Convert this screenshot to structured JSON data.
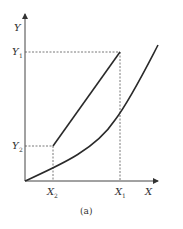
{
  "figure": {
    "caption": "(a)",
    "axes": {
      "x_label": "X",
      "y_label": "Y"
    },
    "y_ticks": [
      {
        "label": "Y",
        "sub": "1"
      },
      {
        "label": "Y",
        "sub": "2"
      }
    ],
    "x_ticks": [
      {
        "label": "X",
        "sub": "2"
      },
      {
        "label": "X",
        "sub": "1"
      }
    ],
    "curves": [
      {
        "name": "upper-straight-line",
        "description": "straight line from (X2, Y2) to (X1, Y1)"
      },
      {
        "name": "lower-curve",
        "description": "convex curve from origin rising steeply past X1"
      }
    ],
    "colors": {
      "line": "#2a2a2a",
      "dashed": "#555555",
      "background": "#ffffff"
    }
  }
}
